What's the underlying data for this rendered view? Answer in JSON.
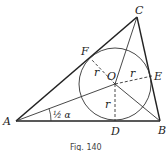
{
  "figure": {
    "caption": "Fig. 140",
    "points": {
      "A": {
        "label": "A",
        "x": 16,
        "y": 121
      },
      "B": {
        "label": "B",
        "x": 160,
        "y": 121
      },
      "C": {
        "label": "C",
        "x": 137,
        "y": 17
      },
      "O": {
        "label": "O",
        "x": 115,
        "y": 84
      },
      "D": {
        "label": "D",
        "x": 115,
        "y": 121
      },
      "E": {
        "label": "E",
        "x": 152,
        "y": 76
      },
      "F": {
        "label": "F",
        "x": 91,
        "y": 59
      }
    },
    "incircle": {
      "cx": 115,
      "cy": 84,
      "r": 36
    },
    "radius_label": "r",
    "angle_label": "½ α",
    "colors": {
      "stroke": "#222222",
      "background": "#ffffff"
    }
  }
}
